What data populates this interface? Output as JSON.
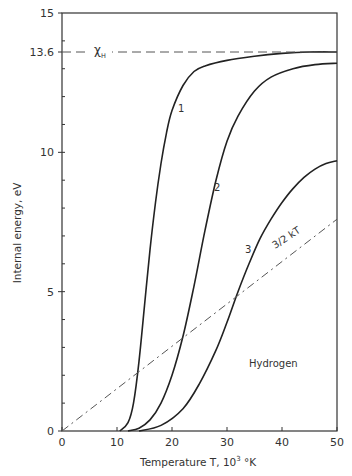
{
  "chart_data": {
    "type": "line",
    "title": "",
    "xlabel": "Temperature T, 10³ °K",
    "ylabel": "Internal energy, eV",
    "xlim": [
      0,
      50
    ],
    "ylim": [
      0,
      15
    ],
    "x_ticks": [
      0,
      10,
      20,
      30,
      40,
      50
    ],
    "x_tick_labels": [
      "0",
      "10",
      "20",
      "30",
      "40",
      "50"
    ],
    "y_ticks": [
      0,
      5,
      10,
      13.6,
      15
    ],
    "y_tick_labels": [
      "0",
      "5",
      "10",
      "13.6",
      "15"
    ],
    "grid": false,
    "legend": null,
    "annotations": [
      {
        "text": "χ",
        "sub": "H",
        "x": 7,
        "y": 13.6,
        "note": "ionization energy reference line"
      },
      {
        "text": "Hydrogen",
        "x": 40,
        "y": 3.2
      },
      {
        "text": "1",
        "x": 21.5,
        "y": 11.3
      },
      {
        "text": "2",
        "x": 28.5,
        "y": 8.8
      },
      {
        "text": "3",
        "x": 33,
        "y": 6.5
      },
      {
        "text": "3/2 kT",
        "x": 41,
        "y": 6.6
      }
    ],
    "series": [
      {
        "name": "1",
        "style": "solid",
        "points": [
          [
            10.5,
            0
          ],
          [
            12,
            0.3
          ],
          [
            13,
            1.0
          ],
          [
            14,
            2.5
          ],
          [
            15,
            4.5
          ],
          [
            16,
            6.5
          ],
          [
            17,
            8.2
          ],
          [
            18,
            9.6
          ],
          [
            19,
            10.7
          ],
          [
            20,
            11.5
          ],
          [
            22,
            12.4
          ],
          [
            24,
            12.9
          ],
          [
            26,
            13.1
          ],
          [
            30,
            13.3
          ],
          [
            35,
            13.45
          ],
          [
            40,
            13.55
          ],
          [
            45,
            13.6
          ],
          [
            50,
            13.6
          ]
        ]
      },
      {
        "name": "2",
        "style": "solid",
        "points": [
          [
            12,
            0
          ],
          [
            14,
            0.1
          ],
          [
            16,
            0.4
          ],
          [
            18,
            1.0
          ],
          [
            20,
            2.0
          ],
          [
            22,
            3.4
          ],
          [
            24,
            5.2
          ],
          [
            26,
            7.2
          ],
          [
            28,
            9.0
          ],
          [
            30,
            10.4
          ],
          [
            32,
            11.3
          ],
          [
            35,
            12.2
          ],
          [
            38,
            12.7
          ],
          [
            42,
            13.0
          ],
          [
            46,
            13.15
          ],
          [
            50,
            13.2
          ]
        ]
      },
      {
        "name": "3",
        "style": "solid",
        "points": [
          [
            14,
            0
          ],
          [
            18,
            0.2
          ],
          [
            22,
            0.8
          ],
          [
            25,
            1.7
          ],
          [
            28,
            2.9
          ],
          [
            30,
            3.9
          ],
          [
            32,
            5.0
          ],
          [
            34,
            6.0
          ],
          [
            36,
            6.9
          ],
          [
            38,
            7.6
          ],
          [
            40,
            8.2
          ],
          [
            42,
            8.7
          ],
          [
            44,
            9.1
          ],
          [
            46,
            9.4
          ],
          [
            48,
            9.6
          ],
          [
            50,
            9.7
          ]
        ]
      },
      {
        "name": "3/2 kT",
        "style": "dash-dot",
        "points": [
          [
            0,
            0
          ],
          [
            50,
            7.6
          ]
        ]
      },
      {
        "name": "χH",
        "style": "dashed",
        "points": [
          [
            0,
            13.6
          ],
          [
            50,
            13.6
          ]
        ]
      }
    ]
  },
  "labels": {
    "xlabel_main": "Temperature T, 10",
    "xlabel_sup": "3",
    "xlabel_unit": " °K",
    "ylabel": "Internal energy, eV",
    "chi": "χ",
    "chi_sub": "H",
    "hydrogen": "Hydrogen",
    "curve1": "1",
    "curve2": "2",
    "curve3": "3",
    "kt": "3/2 kT"
  }
}
